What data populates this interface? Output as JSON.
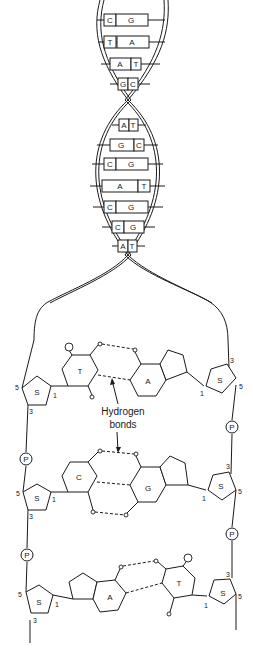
{
  "helix": {
    "base_pairs": [
      {
        "left": "C",
        "right": "G"
      },
      {
        "left": "T",
        "right": "A"
      },
      {
        "left": "A",
        "right": "T"
      },
      {
        "left": "G",
        "right": "C"
      },
      {
        "left": "A",
        "right": "T"
      },
      {
        "left": "G",
        "right": "C"
      },
      {
        "left": "C",
        "right": "G"
      },
      {
        "left": "A",
        "right": "T"
      },
      {
        "left": "C",
        "right": "G"
      },
      {
        "left": "C",
        "right": "G"
      },
      {
        "left": "A",
        "right": "T"
      }
    ]
  },
  "detail": {
    "sugar_label": "S",
    "phosphate_label": "P",
    "pair1": {
      "left_base": "T",
      "right_base": "A"
    },
    "pair2": {
      "left_base": "C",
      "right_base": "G"
    },
    "pair3": {
      "left_base": "A",
      "right_base": "T"
    },
    "carbon_labels": {
      "c5": "5",
      "c3": "3",
      "c1": "1"
    },
    "annotation": {
      "line1": "Hydrogen",
      "line2": "bonds"
    }
  }
}
